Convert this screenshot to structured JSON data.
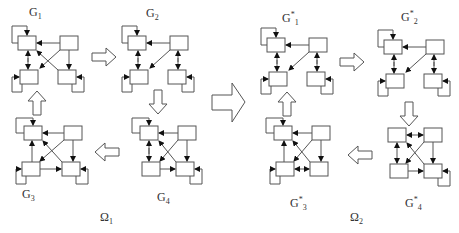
{
  "diagram": {
    "groups": [
      {
        "name": "Ω",
        "sub": "1",
        "graphs": [
          {
            "id": "G1",
            "base": "G",
            "star": "",
            "sub": "1"
          },
          {
            "id": "G2",
            "base": "G",
            "star": "",
            "sub": "2"
          },
          {
            "id": "G3",
            "base": "G",
            "star": "",
            "sub": "3"
          },
          {
            "id": "G4",
            "base": "G",
            "star": "",
            "sub": "4"
          }
        ]
      },
      {
        "name": "Ω",
        "sub": "2",
        "graphs": [
          {
            "id": "G*1",
            "base": "G",
            "star": "*",
            "sub": "1"
          },
          {
            "id": "G*2",
            "base": "G",
            "star": "*",
            "sub": "2"
          },
          {
            "id": "G*3",
            "base": "G",
            "star": "*",
            "sub": "3"
          },
          {
            "id": "G*4",
            "base": "G",
            "star": "*",
            "sub": "4"
          }
        ]
      }
    ],
    "transitions": [
      "G1 → G2",
      "G2 → G4",
      "G4 → G3",
      "G3 → G1",
      "Ω1 ⇒ Ω2",
      "G*1 → G*2",
      "G*2 → G*4",
      "G*4 → G*3",
      "G*3 → G*1"
    ]
  }
}
